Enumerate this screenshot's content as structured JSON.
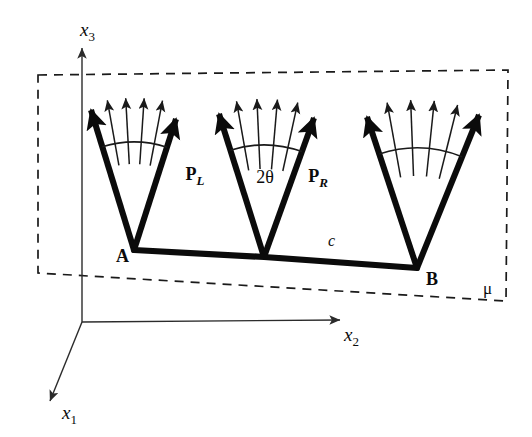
{
  "figure": {
    "background_color": "#ffffff",
    "ink_color": "#0b0b0b",
    "width": 532,
    "height": 437
  },
  "axes": {
    "origin": {
      "x": 82,
      "y": 322
    },
    "items": [
      {
        "name": "x3",
        "base": "x",
        "subscript": "3",
        "label_x": 80,
        "label_y": 36,
        "from_x": 82,
        "from_y": 322,
        "to_x": 82,
        "to_y": 48,
        "direction": "up"
      },
      {
        "name": "x2",
        "base": "x",
        "subscript": "2",
        "label_x": 344,
        "label_y": 341,
        "from_x": 82,
        "from_y": 322,
        "to_x": 340,
        "to_y": 320,
        "direction": "right"
      },
      {
        "name": "x1",
        "base": "x",
        "subscript": "1",
        "label_x": 62,
        "label_y": 419,
        "from_x": 82,
        "from_y": 322,
        "to_x": 50,
        "to_y": 401,
        "direction": "down-left"
      }
    ]
  },
  "plane": {
    "label": "μ",
    "label_x": 483,
    "label_y": 294,
    "corners": [
      {
        "x": 38,
        "y": 75
      },
      {
        "x": 508,
        "y": 70
      },
      {
        "x": 506,
        "y": 301
      },
      {
        "x": 38,
        "y": 273
      }
    ],
    "dash_pattern": "9 7"
  },
  "crack": {
    "segment_label": "c",
    "segment_label_x": 328,
    "segment_label_y": 246,
    "endpoints": [
      {
        "name": "A",
        "label": "A",
        "x": 134,
        "y": 250,
        "label_x": 116,
        "label_y": 262
      },
      {
        "name": "mid",
        "label": "",
        "x": 264,
        "y": 257,
        "label_x": 0,
        "label_y": 0
      },
      {
        "name": "B",
        "label": "B",
        "x": 417,
        "y": 268,
        "label_x": 426,
        "label_y": 285
      }
    ]
  },
  "branch_groups": [
    {
      "name": "branch-fan-left",
      "apex_x": 134,
      "apex_y": 250,
      "left_tip_x": 91,
      "left_tip_y": 110,
      "right_tip_x": 176,
      "right_tip_y": 119,
      "arc_radius": 108,
      "thin_ray_count": 4,
      "thin_inner_radius": 86,
      "thin_outer_radius": 152,
      "angle_label": "",
      "angle_label_x": 0,
      "angle_label_y": 0,
      "left_vector_label": "",
      "left_vector_sub": "",
      "left_label_x": 0,
      "left_label_y": 0,
      "right_vector_label": "",
      "right_vector_sub": "",
      "right_label_x": 0,
      "right_label_y": 0
    },
    {
      "name": "branch-fan-middle",
      "apex_x": 264,
      "apex_y": 257,
      "left_tip_x": 219,
      "left_tip_y": 114,
      "right_tip_x": 314,
      "right_tip_y": 118,
      "arc_radius": 112,
      "thin_ray_count": 4,
      "thin_inner_radius": 88,
      "thin_outer_radius": 158,
      "angle_label": "2θ",
      "angle_label_x": 265,
      "angle_label_y": 183,
      "left_vector_label": "P",
      "left_vector_sub": "L",
      "left_label_x": 195,
      "left_label_y": 180,
      "right_vector_label": "P",
      "right_vector_sub": "R",
      "right_label_x": 318,
      "right_label_y": 182
    },
    {
      "name": "branch-fan-right",
      "apex_x": 417,
      "apex_y": 268,
      "left_tip_x": 367,
      "left_tip_y": 117,
      "right_tip_x": 479,
      "right_tip_y": 115,
      "arc_radius": 120,
      "thin_ray_count": 4,
      "thin_inner_radius": 92,
      "thin_outer_radius": 168,
      "angle_label": "",
      "angle_label_x": 0,
      "angle_label_y": 0,
      "left_vector_label": "",
      "left_vector_sub": "",
      "left_label_x": 0,
      "left_label_y": 0,
      "right_vector_label": "",
      "right_vector_sub": "",
      "right_label_x": 0,
      "right_label_y": 0
    }
  ]
}
